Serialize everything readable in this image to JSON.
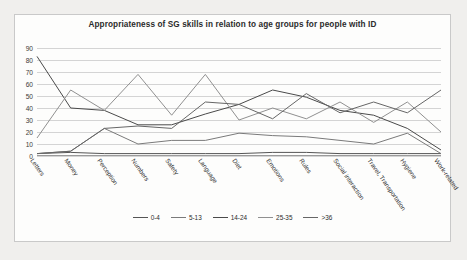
{
  "chart": {
    "title": "Appropriateness of SG skills in relation to age groups for people with ID"
  },
  "chart_data": {
    "type": "line",
    "title": "Appropriateness of SG skills in relation to age groups for people with ID",
    "xlabel": "",
    "ylabel": "",
    "ylim": [
      0,
      90
    ],
    "yticks": [
      0,
      10,
      20,
      30,
      40,
      50,
      60,
      70,
      80,
      90
    ],
    "grid": true,
    "legend_position": "bottom",
    "categories": [
      "Letters",
      "Money",
      "Perception",
      "Numbers",
      "Safety",
      "Language",
      "Diet",
      "Emotions",
      "Rules",
      "Social interaction",
      "Travel, Transportation",
      "Hygiene",
      "Work-related"
    ],
    "series": [
      {
        "name": "0-4",
        "color": "#555555",
        "values": [
          2,
          3,
          2,
          2,
          2,
          2,
          2,
          3,
          3,
          2,
          2,
          2,
          2
        ]
      },
      {
        "name": "5-13",
        "color": "#7a7a7a",
        "values": [
          2,
          4,
          23,
          10,
          13,
          13,
          19,
          17,
          16,
          13,
          10,
          19,
          2
        ]
      },
      {
        "name": "14-24",
        "color": "#4a4a4a",
        "values": [
          83,
          40,
          38,
          26,
          26,
          35,
          43,
          55,
          49,
          38,
          34,
          23,
          5
        ]
      },
      {
        "name": "25-35",
        "color": "#909090",
        "values": [
          15,
          55,
          38,
          68,
          34,
          68,
          30,
          40,
          31,
          45,
          28,
          45,
          20
        ]
      },
      {
        "name": ">36",
        "color": "#666666",
        "values": [
          2,
          4,
          23,
          25,
          23,
          45,
          43,
          31,
          52,
          36,
          45,
          36,
          55
        ]
      }
    ]
  },
  "legend": {
    "items": [
      {
        "label": "0-4"
      },
      {
        "label": "5-13"
      },
      {
        "label": "14-24"
      },
      {
        "label": "25-35"
      },
      {
        "label": ">36"
      }
    ]
  }
}
